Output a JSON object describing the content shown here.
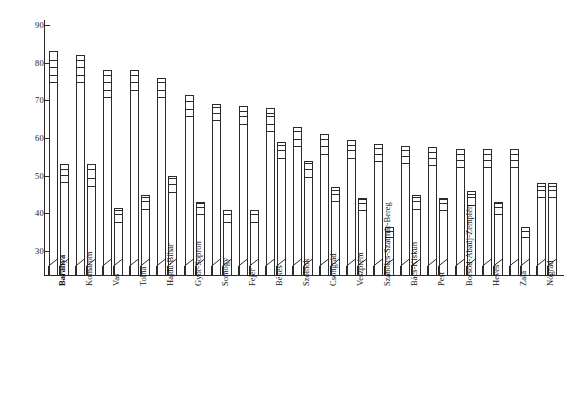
{
  "chart_data": {
    "type": "bar",
    "title": "",
    "subtitle": "",
    "xlabel": "",
    "ylabel": "",
    "ylim": [
      26,
      92
    ],
    "yticks": [
      30,
      40,
      50,
      60,
      70,
      80,
      90
    ],
    "ytick_labels": [
      "30",
      "40",
      "50",
      "60",
      "70",
      "80",
      "90"
    ],
    "grid": false,
    "legend": "none",
    "axis_break": true,
    "axis_break_note": "each bar is drawn with a zig-zag scale-break symbol just above the baseline",
    "categories": [
      "Baranya",
      "Komárom",
      "Vas",
      "Tolna",
      "Hajdú-Bihar",
      "Győr-Sopron",
      "Somogy",
      "Fejér",
      "Békés",
      "Szolnok",
      "Csongrád",
      "Veszprém",
      "Szabolcs-Szatmár-Bereg",
      "Bács-Kiskun",
      "Pest",
      "Borsod-Abaúj-Zemplén",
      "Heves",
      "Zala",
      "Nógrád"
    ],
    "series": [
      {
        "name": "bar-a",
        "values": [
          83,
          82,
          78,
          78,
          76,
          71.5,
          69,
          68.5,
          68,
          63,
          61,
          59.5,
          58.5,
          58,
          57.5,
          57,
          57,
          57,
          48
        ]
      },
      {
        "name": "bar-b",
        "values": [
          53,
          53,
          41.5,
          45,
          50,
          43,
          41,
          41,
          59,
          54,
          47,
          44,
          36.5,
          45,
          44,
          46,
          43,
          36.5,
          48
        ]
      }
    ],
    "rungs": {
      "note": "horizontal tick marks subdividing the top segment of each bar, values on the y scale",
      "series_a": [
        [
          74.5,
          76.5,
          78.5,
          80.5
        ],
        [
          74.5,
          76.5,
          78.5,
          80.5
        ],
        [
          70.5,
          72.5,
          74.5,
          76.5
        ],
        [
          72.5,
          74.5,
          76.5
        ],
        [
          70.5,
          72.5,
          74.5
        ],
        [
          65.5,
          67.5,
          69.5
        ],
        [
          64.5,
          66.5,
          68
        ],
        [
          63.5,
          65.5,
          67
        ],
        [
          61.5,
          63.5,
          65.5,
          66.5
        ],
        [
          57.5,
          59.5,
          61.5
        ],
        [
          55.5,
          57.5,
          59.5
        ],
        [
          54.5,
          56.5,
          58
        ],
        [
          53.5,
          55.5,
          57
        ],
        [
          53,
          55,
          56.5
        ],
        [
          52.5,
          54.5,
          56
        ],
        [
          52,
          54,
          55.5
        ],
        [
          52,
          54,
          55.5
        ],
        [
          52,
          54,
          55.5
        ],
        [
          44,
          46,
          47
        ]
      ],
      "series_b": [
        [
          48,
          50,
          51.5
        ],
        [
          47,
          49,
          51.5
        ],
        [
          37.5,
          39.5,
          40.5
        ],
        [
          41,
          43,
          44
        ],
        [
          45.5,
          47.5,
          49
        ],
        [
          39.5,
          41.5,
          42.5
        ],
        [
          37.5,
          39.5,
          40.5
        ],
        [
          37.5,
          39.5,
          40.5
        ],
        [
          54.5,
          56.5,
          58
        ],
        [
          49.5,
          51.5,
          53
        ],
        [
          43,
          45,
          46
        ],
        [
          40.5,
          42.5,
          43.5
        ],
        [
          33.5,
          35,
          36
        ],
        [
          41,
          43,
          44
        ],
        [
          40.5,
          42.5,
          43.5
        ],
        [
          42,
          44,
          45
        ],
        [
          39.5,
          41.5,
          42.5
        ],
        [
          33.5,
          35,
          36
        ],
        [
          44,
          46,
          47
        ]
      ]
    }
  },
  "style": {
    "line_color": "#2b2b2b",
    "bar_fill": "#ffffff",
    "background": "#ffffff",
    "text_color": "#111111"
  },
  "emphasis": {
    "bold_category": "Baranya"
  }
}
